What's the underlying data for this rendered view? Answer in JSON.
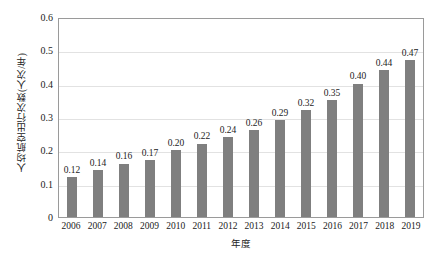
{
  "chart_data": {
    "type": "bar",
    "title": "",
    "xlabel": "年度",
    "ylabel": "人均航空出行次数(人次/年)",
    "categories": [
      "2006",
      "2007",
      "2008",
      "2009",
      "2010",
      "2011",
      "2012",
      "2013",
      "2014",
      "2015",
      "2016",
      "2017",
      "2018",
      "2019"
    ],
    "values": [
      0.12,
      0.14,
      0.16,
      0.17,
      0.2,
      0.22,
      0.24,
      0.26,
      0.29,
      0.32,
      0.35,
      0.4,
      0.44,
      0.47
    ],
    "value_labels": [
      "0.12",
      "0.14",
      "0.16",
      "0.17",
      "0.20",
      "0.22",
      "0.24",
      "0.26",
      "0.29",
      "0.32",
      "0.35",
      "0.40",
      "0.44",
      "0.47"
    ],
    "ylim": [
      0,
      0.6
    ],
    "ytick_labels": [
      "0.6",
      "0.5",
      "0.4",
      "0.3",
      "0.2",
      "0.1",
      "0"
    ],
    "ytick_values": [
      0.6,
      0.5,
      0.4,
      0.3,
      0.2,
      0.1,
      0
    ],
    "grid": "horizontal",
    "legend": "none",
    "series_color": "#7f7f7f",
    "gridline_color": "#e2e2e2",
    "axis_color": "#9a9a9a",
    "background_color": "#ffffff"
  }
}
